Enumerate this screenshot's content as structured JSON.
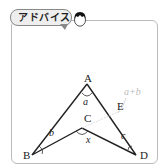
{
  "header": {
    "advice_label": "アドバイス"
  },
  "diagram": {
    "points": {
      "A": "A",
      "B": "B",
      "C": "C",
      "D": "D",
      "E": "E"
    },
    "angles": {
      "a": "a",
      "b": "b",
      "c": "c",
      "x": "x",
      "a_plus_b": "a+b"
    }
  }
}
